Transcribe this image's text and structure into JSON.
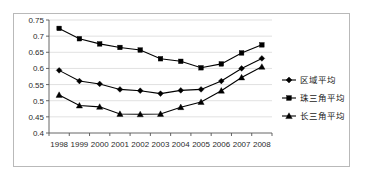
{
  "chart_data": {
    "type": "line",
    "title": "",
    "xlabel": "",
    "ylabel": "",
    "categories": [
      "1998",
      "1999",
      "2000",
      "2001",
      "2002",
      "2003",
      "2004",
      "2005",
      "2006",
      "2007",
      "2008"
    ],
    "ylim": [
      0.4,
      0.75
    ],
    "yticks": [
      "0.4",
      "0.45",
      "0.5",
      "0.55",
      "0.6",
      "0.65",
      "0.7",
      "0.75"
    ],
    "ytick_values": [
      0.4,
      0.45,
      0.5,
      0.55,
      0.6,
      0.65,
      0.7,
      0.75
    ],
    "grid": true,
    "legend_position": "right",
    "series": [
      {
        "name": "区域平均",
        "marker": "diamond",
        "values": [
          0.594,
          0.561,
          0.552,
          0.535,
          0.531,
          0.522,
          0.532,
          0.535,
          0.561,
          0.6,
          0.631
        ]
      },
      {
        "name": "珠三角平均",
        "marker": "square",
        "values": [
          0.724,
          0.692,
          0.676,
          0.665,
          0.657,
          0.63,
          0.622,
          0.602,
          0.614,
          0.648,
          0.673
        ]
      },
      {
        "name": "长三角平均",
        "marker": "triangle",
        "values": [
          0.518,
          0.485,
          0.481,
          0.459,
          0.458,
          0.459,
          0.48,
          0.496,
          0.531,
          0.572,
          0.605
        ]
      }
    ]
  },
  "colors": {
    "series_stroke": "#000000",
    "gridline": "#d2d2d2",
    "axis": "#555555",
    "frame_border": "#b9b9b9",
    "background": "#ffffff",
    "tick_text": "#2b2b2b"
  }
}
